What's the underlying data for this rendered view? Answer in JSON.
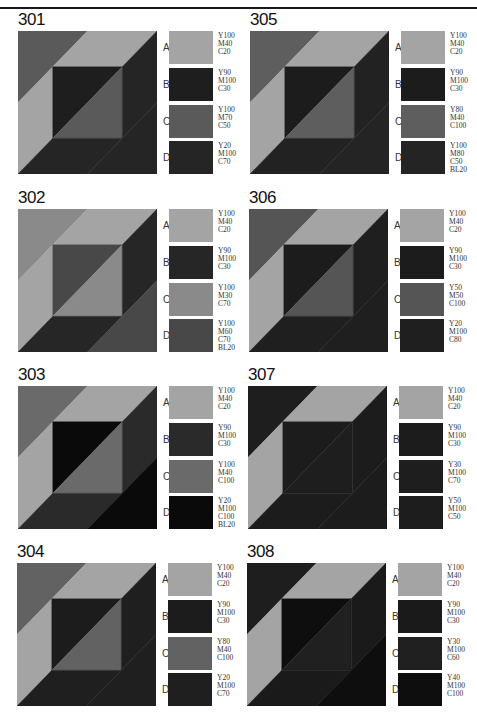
{
  "panels": [
    {
      "id": "301",
      "x": 18,
      "y": 11,
      "regions": {
        "tl": "#5a5a5a",
        "band_a": "#a4a4a4",
        "inner_ul": "#1e1e1e",
        "inner_lr": "#5a5a5a",
        "band_rb": "#252525",
        "br": "#252525"
      },
      "swatches": [
        {
          "letter": "A",
          "color": "#a4a4a4",
          "code": "Y100\nM40\nC20"
        },
        {
          "letter": "B",
          "color": "#1e1e1e",
          "code": "Y90\nM100\nC30"
        },
        {
          "letter": "C",
          "color": "#5a5a5a",
          "code": "Y100\nM70\nC50"
        },
        {
          "letter": "D",
          "color": "#252525",
          "code": "Y20\nM100\nC70"
        }
      ]
    },
    {
      "id": "302",
      "x": 18,
      "y": 189,
      "regions": {
        "tl": "#8a8a8a",
        "band_a": "#a4a4a4",
        "inner_ul": "#484848",
        "inner_lr": "#8a8a8a",
        "band_rb": "#262626",
        "br": "#484848"
      },
      "swatches": [
        {
          "letter": "A",
          "color": "#a4a4a4",
          "code": "Y100\nM40\nC20"
        },
        {
          "letter": "B",
          "color": "#262626",
          "code": "Y90\nM100\nC30"
        },
        {
          "letter": "C",
          "color": "#8a8a8a",
          "code": "Y100\nM30\nC70"
        },
        {
          "letter": "D",
          "color": "#484848",
          "code": "Y100\nM60\nC70\nBL20"
        }
      ]
    },
    {
      "id": "303",
      "x": 18,
      "y": 366,
      "regions": {
        "tl": "#6a6a6a",
        "band_a": "#a4a4a4",
        "inner_ul": "#0a0a0a",
        "inner_lr": "#6a6a6a",
        "band_rb": "#2a2a2a",
        "br": "#0a0a0a"
      },
      "swatches": [
        {
          "letter": "A",
          "color": "#a4a4a4",
          "code": "Y100\nM40\nC20"
        },
        {
          "letter": "B",
          "color": "#2a2a2a",
          "code": "Y90\nM100\nC30"
        },
        {
          "letter": "C",
          "color": "#6a6a6a",
          "code": "Y100\nM40\nC100"
        },
        {
          "letter": "D",
          "color": "#0a0a0a",
          "code": "Y20\nM100\nC100\nBL20"
        }
      ]
    },
    {
      "id": "304",
      "x": 17,
      "y": 543,
      "regions": {
        "tl": "#626262",
        "band_a": "#a4a4a4",
        "inner_ul": "#1c1c1c",
        "inner_lr": "#626262",
        "band_rb": "#1f1f1f",
        "br": "#1f1f1f"
      },
      "swatches": [
        {
          "letter": "A",
          "color": "#a4a4a4",
          "code": "Y100\nM40\nC20"
        },
        {
          "letter": "B",
          "color": "#1c1c1c",
          "code": "Y90\nM100\nC30"
        },
        {
          "letter": "C",
          "color": "#626262",
          "code": "Y80\nM40\nC100"
        },
        {
          "letter": "D",
          "color": "#1f1f1f",
          "code": "Y20\nM100\nC70"
        }
      ]
    },
    {
      "id": "305",
      "x": 250,
      "y": 11,
      "regions": {
        "tl": "#5e5e5e",
        "band_a": "#a4a4a4",
        "inner_ul": "#1c1c1c",
        "inner_lr": "#5e5e5e",
        "band_rb": "#222222",
        "br": "#242424"
      },
      "swatches": [
        {
          "letter": "A",
          "color": "#a4a4a4",
          "code": "Y100\nM40\nC20"
        },
        {
          "letter": "B",
          "color": "#1c1c1c",
          "code": "Y90\nM100\nC30"
        },
        {
          "letter": "C",
          "color": "#5e5e5e",
          "code": "Y80\nM40\nC100"
        },
        {
          "letter": "D",
          "color": "#242424",
          "code": "Y100\nM80\nC50\nBL20"
        }
      ]
    },
    {
      "id": "306",
      "x": 249,
      "y": 189,
      "regions": {
        "tl": "#555555",
        "band_a": "#a4a4a4",
        "inner_ul": "#1c1c1c",
        "inner_lr": "#555555",
        "band_rb": "#1f1f1f",
        "br": "#1f1f1f"
      },
      "swatches": [
        {
          "letter": "A",
          "color": "#a4a4a4",
          "code": "Y100\nM40\nC20"
        },
        {
          "letter": "B",
          "color": "#1c1c1c",
          "code": "Y90\nM100\nC30"
        },
        {
          "letter": "C",
          "color": "#555555",
          "code": "Y50\nM50\nC100"
        },
        {
          "letter": "D",
          "color": "#1f1f1f",
          "code": "Y20\nM100\nC80"
        }
      ]
    },
    {
      "id": "307",
      "x": 248,
      "y": 366,
      "regions": {
        "tl": "#1e1e1e",
        "band_a": "#a4a4a4",
        "inner_ul": "#1c1c1c",
        "inner_lr": "#1e1e1e",
        "band_rb": "#1c1c1c",
        "br": "#1c1c1c"
      },
      "swatches": [
        {
          "letter": "A",
          "color": "#a4a4a4",
          "code": "Y100\nM40\nC20"
        },
        {
          "letter": "B",
          "color": "#1c1c1c",
          "code": "Y90\nM100\nC30"
        },
        {
          "letter": "C",
          "color": "#1e1e1e",
          "code": "Y30\nM100\nC70"
        },
        {
          "letter": "D",
          "color": "#1d1d1d",
          "code": "Y50\nM100\nC50"
        }
      ]
    },
    {
      "id": "308",
      "x": 247,
      "y": 543,
      "regions": {
        "tl": "#1e1e1e",
        "band_a": "#a4a4a4",
        "inner_ul": "#0e0e0e",
        "inner_lr": "#202020",
        "band_rb": "#1a1a1a",
        "br": "#0e0e0e"
      },
      "swatches": [
        {
          "letter": "A",
          "color": "#a4a4a4",
          "code": "Y100\nM40\nC20"
        },
        {
          "letter": "B",
          "color": "#1a1a1a",
          "code": "Y90\nM100\nC30"
        },
        {
          "letter": "C",
          "color": "#202020",
          "code": "Y30\nM100\nC60"
        },
        {
          "letter": "D",
          "color": "#0e0e0e",
          "code": "Y40\nM100\nC100"
        }
      ]
    }
  ]
}
